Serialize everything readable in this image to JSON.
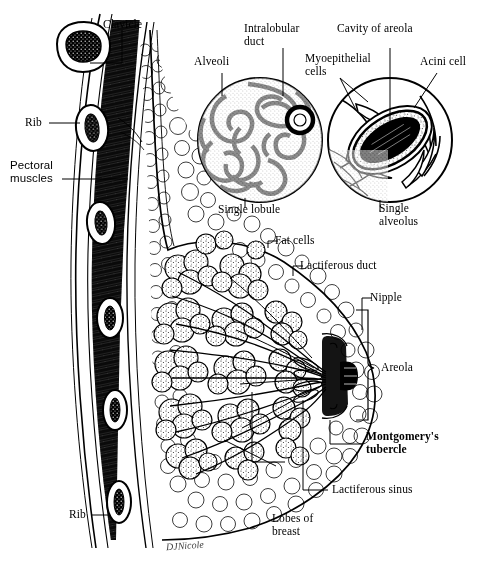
{
  "figure": {
    "background_color": "#ffffff",
    "ink_color": "#000000",
    "signature": "DJNicole"
  },
  "labels": {
    "clavicle": "Clavicle",
    "rib_top": "Rib",
    "pectoral_muscles": "Pectoral\nmuscles",
    "alveoli": "Alveoli",
    "intralobular_duct": "Intralobular\nduct",
    "cavity_of_areola": "Cavity of areola",
    "myoepithelial_cells": "Myoepithelial\ncells",
    "acini_cell": "Acini cell",
    "single_lobule": "Single lobule",
    "single_alveolus": "Single\nalveolus",
    "fat_cells": "Fat cells",
    "lactiferous_duct": "Lactiferous duct",
    "nipple": "Nipple",
    "areola": "Areola",
    "montgomerys_tubercle": "Montgomery's\ntubercle",
    "lactiferous_sinus": "Lactiferous sinus",
    "lobes_of_breast": "Lobes of\nbreast",
    "rib_bottom": "Rib"
  },
  "structures": {
    "chest_wall": "chest-wall-section",
    "clavicle_bone": "clavicle-cross-section",
    "ribs": "rib-cross-sections",
    "pectoral_muscle_mass": "striated-pectoral-muscle",
    "fat_tissue": "subcutaneous-fat-cells",
    "glandular_lobes": "glandular-lobes-mass",
    "duct_system": "lactiferous-duct-network",
    "nipple_areola": "nipple-and-areola",
    "inset_lobule": "single-lobule-inset-circle",
    "inset_alveolus": "single-alveolus-inset-circle"
  }
}
